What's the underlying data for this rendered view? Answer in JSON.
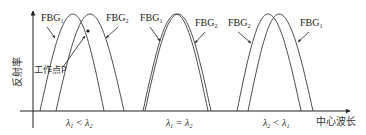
{
  "diagram": {
    "type": "fbg-spectrum-matching",
    "y_axis_label": "反射率",
    "x_axis_label": "中心波长",
    "working_point_label": "工作点P",
    "colors": {
      "line": "#3a3a3a",
      "text": "#1a1a1a",
      "background": "#ffffff"
    },
    "panels": [
      {
        "condition": "λ1 < λ2",
        "curves": [
          {
            "name": "FBG",
            "sub": "1",
            "peak_x": 73,
            "left_x": 40,
            "right_x": 104
          },
          {
            "name": "FBG",
            "sub": "2",
            "peak_x": 90,
            "left_x": 56,
            "right_x": 124
          }
        ],
        "left_label": {
          "name": "FBG",
          "sub": "1"
        },
        "right_label": {
          "name": "FBG",
          "sub": "2"
        },
        "has_working_point": true
      },
      {
        "condition": "λ1 = λ2",
        "curves": [
          {
            "name": "FBG",
            "sub": "1",
            "peak_x": 176,
            "left_x": 143,
            "right_x": 208
          },
          {
            "name": "FBG",
            "sub": "2",
            "peak_x": 178,
            "left_x": 145,
            "right_x": 211
          }
        ],
        "left_label": {
          "name": "FBG",
          "sub": "1"
        },
        "right_label": {
          "name": "FBG",
          "sub": "2"
        },
        "has_working_point": false
      },
      {
        "condition": "λ2 < λ1",
        "curves": [
          {
            "name": "FBG",
            "sub": "2",
            "peak_x": 268,
            "left_x": 237,
            "right_x": 301
          },
          {
            "name": "FBG",
            "sub": "1",
            "peak_x": 279,
            "left_x": 248,
            "right_x": 313
          }
        ],
        "left_label": {
          "name": "FBG",
          "sub": "2"
        },
        "right_label": {
          "name": "FBG",
          "sub": "1"
        },
        "has_working_point": false
      }
    ]
  }
}
